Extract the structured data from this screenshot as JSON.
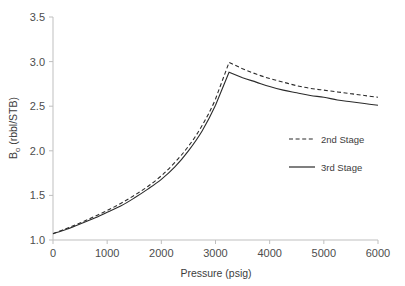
{
  "chart_data": {
    "type": "line",
    "title": "",
    "xlabel": "Pressure (psig)",
    "ylabel_main": "B",
    "ylabel_sub": "o",
    "ylabel_rest": " (rbbl/STB)",
    "ylabel": "Bo (rbbl/STB)",
    "xlim": [
      0,
      6000
    ],
    "ylim": [
      1.0,
      3.5
    ],
    "xticks": [
      0,
      1000,
      2000,
      3000,
      4000,
      5000,
      6000
    ],
    "xtick_labels": [
      "0",
      "1000",
      "2000",
      "3000",
      "4000",
      "5000",
      "6000"
    ],
    "yticks": [
      1.0,
      1.5,
      2.0,
      2.5,
      3.0,
      3.5
    ],
    "ytick_labels": [
      "1.0",
      "1.5",
      "2.0",
      "2.5",
      "3.0",
      "3.5"
    ],
    "grid": false,
    "legend_position": "center-right",
    "bubble_point_pressure": 3250,
    "series": [
      {
        "name": "2nd Stage",
        "style": "dashed",
        "color": "#2b2b2b",
        "x": [
          0,
          250,
          500,
          750,
          1000,
          1250,
          1500,
          1750,
          2000,
          2250,
          2500,
          2750,
          3000,
          3250,
          3500,
          3750,
          4000,
          4250,
          4500,
          4750,
          5000,
          5250,
          5500,
          5750,
          6000
        ],
        "y": [
          1.07,
          1.13,
          1.19,
          1.26,
          1.33,
          1.41,
          1.5,
          1.6,
          1.72,
          1.87,
          2.05,
          2.28,
          2.58,
          2.99,
          2.92,
          2.86,
          2.81,
          2.77,
          2.73,
          2.7,
          2.68,
          2.66,
          2.64,
          2.62,
          2.6
        ]
      },
      {
        "name": "3rd Stage",
        "style": "solid",
        "color": "#2b2b2b",
        "x": [
          0,
          250,
          500,
          750,
          1000,
          1250,
          1500,
          1750,
          2000,
          2250,
          2500,
          2750,
          3000,
          3250,
          3500,
          3750,
          4000,
          4250,
          4500,
          4750,
          5000,
          5250,
          5500,
          5750,
          6000
        ],
        "y": [
          1.07,
          1.12,
          1.18,
          1.24,
          1.31,
          1.38,
          1.47,
          1.57,
          1.68,
          1.82,
          2.0,
          2.22,
          2.51,
          2.88,
          2.82,
          2.77,
          2.72,
          2.68,
          2.65,
          2.62,
          2.6,
          2.57,
          2.55,
          2.53,
          2.51
        ]
      }
    ],
    "legend": [
      {
        "label": "2nd Stage",
        "style": "dashed"
      },
      {
        "label": "3rd Stage",
        "style": "solid"
      }
    ],
    "colors": {
      "axis": "#bfbfbf",
      "tick_text": "#4d4d4d",
      "curve": "#2b2b2b",
      "background": "#ffffff"
    }
  }
}
